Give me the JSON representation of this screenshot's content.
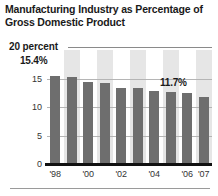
{
  "title": "Manufacturing Industry as Percentage of Gross Domestic Product",
  "top_axis_label": "20 percent",
  "callouts": {
    "first": "15.4%",
    "last": "11.7%"
  },
  "colors": {
    "bar": "#6e6e6e",
    "band": "#e6e6e6",
    "gridline": "#b5b5b5",
    "baseline": "#111111",
    "text": "#1a1a1a"
  },
  "chart_data": {
    "type": "bar",
    "title": "Manufacturing Industry as Percentage of Gross Domestic Product",
    "xlabel": "",
    "ylabel": "percent",
    "ylim": [
      0,
      20
    ],
    "yticks": [
      15,
      10,
      5,
      0
    ],
    "ytick_labels": [
      "15",
      "10",
      "5",
      "0"
    ],
    "grid": true,
    "legend": "none",
    "categories": [
      "1998",
      "1999",
      "2000",
      "2001",
      "2002",
      "2003",
      "2004",
      "2005",
      "2006",
      "2007"
    ],
    "xtick_labels": [
      "'98",
      "",
      "'00",
      "",
      "'02",
      "",
      "'04",
      "",
      "'06",
      "'07"
    ],
    "values": [
      15.4,
      15.2,
      14.4,
      14.2,
      13.4,
      13.4,
      12.8,
      12.6,
      12.4,
      11.7
    ],
    "data_labels": {
      "1998": "15.4%",
      "2007": "11.7%"
    },
    "annotations": [
      "20 percent"
    ]
  }
}
